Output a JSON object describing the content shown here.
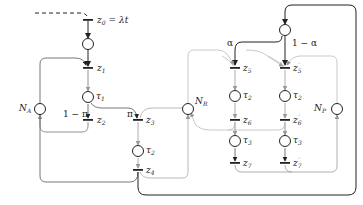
{
  "diagram": {
    "type": "petri-net",
    "colors": {
      "dark": "#222222",
      "gray": "#999999",
      "light": "#bbbbbb"
    },
    "labels": {
      "z0": "z",
      "z0_sub": "0",
      "z0_eq": "= λt",
      "z1": "z",
      "z1_sub": "1",
      "z2": "z",
      "z2_sub": "2",
      "z3": "z",
      "z3_sub": "3",
      "z4": "z",
      "z4_sub": "4",
      "z5": "z",
      "z5_sub": "5",
      "z5p": "z",
      "z5p_sub": "5",
      "z5p_prime": "′",
      "z6": "z",
      "z6_sub": "6",
      "z6p": "z",
      "z6p_sub": "6",
      "z6p_prime": "′",
      "z7": "z",
      "z7_sub": "7",
      "z7p": "z",
      "z7p_sub": "7",
      "z7p_prime": "′",
      "tau1": "τ",
      "tau1_sub": "1",
      "tau2": "τ",
      "tau2_sub": "2",
      "tau3": "τ",
      "tau3_sub": "3",
      "NA": "N",
      "NA_sub": "A",
      "NR": "N",
      "NR_sub": "R",
      "NP": "N",
      "NP_sub": "P",
      "pi": "π",
      "one_minus_pi": "1 − π",
      "alpha": "α",
      "one_minus_alpha": "1 − α"
    }
  }
}
